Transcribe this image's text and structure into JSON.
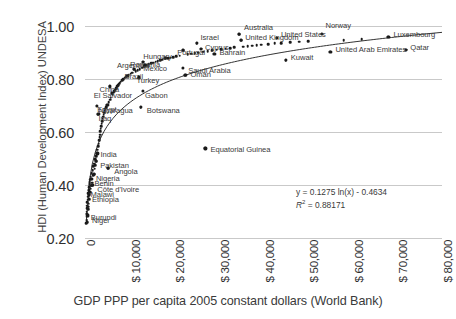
{
  "chart_data": {
    "type": "scatter",
    "title": "",
    "xlabel": "GDP PPP per capita 2005 constant dollars (World Bank)",
    "ylabel": "HDI (Human Development Index) UNDESA",
    "xlim": [
      0,
      80000
    ],
    "ylim": [
      0.2,
      1.0
    ],
    "grid": true,
    "legend": "none",
    "x_ticks": [
      "0",
      "$ 10,000",
      "$ 20,000",
      "$ 30,000",
      "$ 40,000",
      "$ 50,000",
      "$ 60,000",
      "$ 70,000",
      "$ 80,000"
    ],
    "y_ticks": [
      "1.00",
      "0.80",
      "0.60",
      "0.40",
      "0.20"
    ],
    "y_tick_values": [
      1.0,
      0.8,
      0.6,
      0.4,
      0.2
    ],
    "x_tick_values": [
      0,
      10000,
      20000,
      30000,
      40000,
      50000,
      60000,
      70000,
      80000
    ],
    "trendline": {
      "type": "logarithmic",
      "equation": "y = 0.1275 ln(x) - 0.4634",
      "r_squared_label": "R",
      "r_squared_exponent": "2",
      "r_squared_value": "= 0.88171",
      "coefficient": 0.1275,
      "intercept": -0.4634,
      "r2": 0.88171
    },
    "labeled_points": [
      {
        "name": "Norway",
        "x": 53000,
        "y": 0.971
      },
      {
        "name": "United States",
        "x": 43000,
        "y": 0.956
      },
      {
        "name": "Australia",
        "x": 34500,
        "y": 0.97
      },
      {
        "name": "United Kingdom",
        "x": 35000,
        "y": 0.947
      },
      {
        "name": "Luxembourg",
        "x": 68000,
        "y": 0.96
      },
      {
        "name": "Qatar",
        "x": 72000,
        "y": 0.91
      },
      {
        "name": "United Arab Emirates",
        "x": 55000,
        "y": 0.903
      },
      {
        "name": "Kuwait",
        "x": 45000,
        "y": 0.871
      },
      {
        "name": "Israel",
        "x": 25000,
        "y": 0.935
      },
      {
        "name": "Cyprus",
        "x": 26000,
        "y": 0.914
      },
      {
        "name": "Hungary",
        "x": 18000,
        "y": 0.879
      },
      {
        "name": "Portugal",
        "x": 22000,
        "y": 0.909
      },
      {
        "name": "Bahrain",
        "x": 29000,
        "y": 0.895
      },
      {
        "name": "Argentina",
        "x": 13000,
        "y": 0.866
      },
      {
        "name": "Romania",
        "x": 11000,
        "y": 0.837
      },
      {
        "name": "Mexico",
        "x": 13500,
        "y": 0.854
      },
      {
        "name": "Saudi Arabia",
        "x": 22000,
        "y": 0.843
      },
      {
        "name": "Oman",
        "x": 22500,
        "y": 0.814
      },
      {
        "name": "Brazil",
        "x": 9500,
        "y": 0.813
      },
      {
        "name": "Turkey",
        "x": 12000,
        "y": 0.806
      },
      {
        "name": "China",
        "x": 5500,
        "y": 0.772
      },
      {
        "name": "El Salvador",
        "x": 6000,
        "y": 0.747
      },
      {
        "name": "Gabon",
        "x": 13000,
        "y": 0.755
      },
      {
        "name": "Egypt",
        "x": 5000,
        "y": 0.703
      },
      {
        "name": "Botswana",
        "x": 12500,
        "y": 0.694
      },
      {
        "name": "Nicaragua",
        "x": 2600,
        "y": 0.699
      },
      {
        "name": "Iraq",
        "x": 3000,
        "y": 0.667
      },
      {
        "name": "Equatorial Guinea",
        "x": 27000,
        "y": 0.538
      },
      {
        "name": "India",
        "x": 2800,
        "y": 0.519
      },
      {
        "name": "Pakistan",
        "x": 2500,
        "y": 0.49
      },
      {
        "name": "Angola",
        "x": 5200,
        "y": 0.464
      },
      {
        "name": "Nigeria",
        "x": 2000,
        "y": 0.441
      },
      {
        "name": "Benin",
        "x": 1450,
        "y": 0.424
      },
      {
        "name": "Côte d'Ivoire",
        "x": 1650,
        "y": 0.4
      },
      {
        "name": "Malawi",
        "x": 800,
        "y": 0.383
      },
      {
        "name": "Ethiopia",
        "x": 870,
        "y": 0.363
      },
      {
        "name": "Burundi",
        "x": 380,
        "y": 0.29
      },
      {
        "name": "Niger",
        "x": 650,
        "y": 0.285
      }
    ],
    "unlabeled_point_count": 150,
    "points": [
      [
        310,
        0.255
      ],
      [
        340,
        0.268
      ],
      [
        370,
        0.282
      ],
      [
        400,
        0.292
      ],
      [
        420,
        0.3
      ],
      [
        450,
        0.312
      ],
      [
        480,
        0.322
      ],
      [
        520,
        0.26
      ],
      [
        560,
        0.335
      ],
      [
        600,
        0.288
      ],
      [
        640,
        0.345
      ],
      [
        680,
        0.308
      ],
      [
        700,
        0.356
      ],
      [
        740,
        0.318
      ],
      [
        780,
        0.369
      ],
      [
        820,
        0.33
      ],
      [
        860,
        0.378
      ],
      [
        900,
        0.363
      ],
      [
        940,
        0.392
      ],
      [
        980,
        0.347
      ],
      [
        1020,
        0.402
      ],
      [
        1080,
        0.41
      ],
      [
        1140,
        0.372
      ],
      [
        1200,
        0.42
      ],
      [
        1260,
        0.386
      ],
      [
        1320,
        0.432
      ],
      [
        1400,
        0.398
      ],
      [
        1450,
        0.424
      ],
      [
        1520,
        0.444
      ],
      [
        1600,
        0.409
      ],
      [
        1650,
        0.4
      ],
      [
        1720,
        0.455
      ],
      [
        1800,
        0.47
      ],
      [
        1900,
        0.437
      ],
      [
        2000,
        0.441
      ],
      [
        2050,
        0.481
      ],
      [
        2150,
        0.462
      ],
      [
        2250,
        0.497
      ],
      [
        2350,
        0.474
      ],
      [
        2450,
        0.508
      ],
      [
        2500,
        0.49
      ],
      [
        2600,
        0.699
      ],
      [
        2650,
        0.52
      ],
      [
        2750,
        0.533
      ],
      [
        2800,
        0.519
      ],
      [
        2900,
        0.546
      ],
      [
        3000,
        0.667
      ],
      [
        3050,
        0.556
      ],
      [
        3150,
        0.57
      ],
      [
        3250,
        0.58
      ],
      [
        3350,
        0.59
      ],
      [
        3450,
        0.602
      ],
      [
        3550,
        0.612
      ],
      [
        3650,
        0.622
      ],
      [
        3750,
        0.632
      ],
      [
        3850,
        0.641
      ],
      [
        3950,
        0.65
      ],
      [
        4050,
        0.658
      ],
      [
        4150,
        0.666
      ],
      [
        4250,
        0.673
      ],
      [
        4400,
        0.68
      ],
      [
        4550,
        0.688
      ],
      [
        4700,
        0.694
      ],
      [
        4850,
        0.7
      ],
      [
        5000,
        0.703
      ],
      [
        5200,
        0.464
      ],
      [
        5350,
        0.712
      ],
      [
        5500,
        0.772
      ],
      [
        5650,
        0.722
      ],
      [
        5800,
        0.73
      ],
      [
        6000,
        0.747
      ],
      [
        6200,
        0.74
      ],
      [
        6400,
        0.748
      ],
      [
        6600,
        0.754
      ],
      [
        6800,
        0.76
      ],
      [
        7000,
        0.766
      ],
      [
        7200,
        0.772
      ],
      [
        7400,
        0.777
      ],
      [
        7600,
        0.782
      ],
      [
        7800,
        0.786
      ],
      [
        8000,
        0.79
      ],
      [
        8300,
        0.796
      ],
      [
        8600,
        0.8
      ],
      [
        8900,
        0.805
      ],
      [
        9200,
        0.808
      ],
      [
        9500,
        0.813
      ],
      [
        9800,
        0.816
      ],
      [
        10200,
        0.82
      ],
      [
        10600,
        0.824
      ],
      [
        11000,
        0.837
      ],
      [
        11400,
        0.83
      ],
      [
        11800,
        0.834
      ],
      [
        12000,
        0.806
      ],
      [
        12300,
        0.838
      ],
      [
        12500,
        0.694
      ],
      [
        12800,
        0.842
      ],
      [
        13000,
        0.866
      ],
      [
        13300,
        0.848
      ],
      [
        13500,
        0.854
      ],
      [
        13800,
        0.852
      ],
      [
        14300,
        0.856
      ],
      [
        14800,
        0.859
      ],
      [
        15300,
        0.862
      ],
      [
        15800,
        0.865
      ],
      [
        16300,
        0.868
      ],
      [
        16800,
        0.871
      ],
      [
        17300,
        0.873
      ],
      [
        18000,
        0.879
      ],
      [
        18600,
        0.878
      ],
      [
        19200,
        0.881
      ],
      [
        19800,
        0.883
      ],
      [
        20500,
        0.886
      ],
      [
        21200,
        0.888
      ],
      [
        22000,
        0.909
      ],
      [
        22500,
        0.814
      ],
      [
        23000,
        0.893
      ],
      [
        23800,
        0.895
      ],
      [
        24600,
        0.897
      ],
      [
        25000,
        0.935
      ],
      [
        25400,
        0.899
      ],
      [
        26000,
        0.914
      ],
      [
        26500,
        0.903
      ],
      [
        27000,
        0.538
      ],
      [
        27500,
        0.905
      ],
      [
        28500,
        0.908
      ],
      [
        29000,
        0.895
      ],
      [
        29500,
        0.91
      ],
      [
        30500,
        0.912
      ],
      [
        31500,
        0.915
      ],
      [
        32500,
        0.917
      ],
      [
        33500,
        0.919
      ],
      [
        34500,
        0.97
      ],
      [
        35000,
        0.947
      ],
      [
        35500,
        0.922
      ],
      [
        36500,
        0.924
      ],
      [
        37500,
        0.926
      ],
      [
        38500,
        0.928
      ],
      [
        39500,
        0.93
      ],
      [
        41000,
        0.932
      ],
      [
        42500,
        0.934
      ],
      [
        43000,
        0.956
      ],
      [
        44000,
        0.936
      ],
      [
        45000,
        0.871
      ],
      [
        46000,
        0.938
      ],
      [
        48000,
        0.94
      ],
      [
        50000,
        0.943
      ],
      [
        53000,
        0.971
      ],
      [
        55000,
        0.903
      ],
      [
        58000,
        0.947
      ],
      [
        62000,
        0.95
      ],
      [
        68000,
        0.96
      ],
      [
        72000,
        0.91
      ]
    ]
  }
}
